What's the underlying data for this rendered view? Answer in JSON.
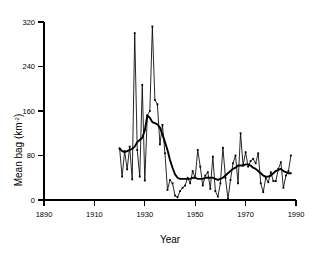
{
  "chart_data": {
    "type": "line",
    "title": "",
    "xlabel": "Year",
    "ylabel": "Mean bag (km",
    "ylabel_sup": "-2",
    "ylabel_suffix": ")",
    "xlim": [
      1890,
      1990
    ],
    "ylim": [
      0,
      320
    ],
    "xticks": [
      1890,
      1910,
      1930,
      1950,
      1970,
      1990
    ],
    "yticks": [
      0,
      80,
      160,
      240,
      320
    ],
    "grid": false,
    "legend": "none",
    "series": [
      {
        "name": "Annual mean bag",
        "style": "thin-line-with-markers",
        "x": [
          1920,
          1921,
          1922,
          1923,
          1924,
          1925,
          1926,
          1927,
          1928,
          1929,
          1930,
          1931,
          1932,
          1933,
          1934,
          1935,
          1936,
          1937,
          1938,
          1939,
          1940,
          1941,
          1942,
          1943,
          1944,
          1945,
          1946,
          1947,
          1948,
          1949,
          1950,
          1951,
          1952,
          1953,
          1954,
          1955,
          1956,
          1957,
          1958,
          1959,
          1960,
          1961,
          1962,
          1963,
          1964,
          1965,
          1966,
          1967,
          1968,
          1969,
          1970,
          1971,
          1972,
          1973,
          1974,
          1975,
          1976,
          1977,
          1978,
          1979,
          1980,
          1981,
          1982,
          1983,
          1984,
          1985,
          1986,
          1987,
          1988
        ],
        "values": [
          93,
          42,
          88,
          55,
          96,
          37,
          300,
          90,
          42,
          207,
          35,
          152,
          160,
          312,
          180,
          172,
          100,
          135,
          84,
          18,
          36,
          30,
          8,
          5,
          16,
          22,
          26,
          40,
          30,
          52,
          40,
          90,
          60,
          26,
          44,
          50,
          20,
          78,
          16,
          6,
          30,
          94,
          40,
          2,
          36,
          66,
          80,
          30,
          120,
          62,
          86,
          60,
          70,
          74,
          66,
          84,
          30,
          14,
          40,
          32,
          50,
          34,
          34,
          56,
          68,
          22,
          44,
          52,
          80
        ]
      },
      {
        "name": "Smoothed trend",
        "style": "thick-line",
        "x": [
          1920,
          1921,
          1922,
          1923,
          1924,
          1925,
          1926,
          1927,
          1928,
          1929,
          1930,
          1931,
          1932,
          1933,
          1934,
          1935,
          1936,
          1937,
          1938,
          1939,
          1940,
          1941,
          1942,
          1943,
          1944,
          1945,
          1946,
          1947,
          1948,
          1949,
          1950,
          1951,
          1952,
          1953,
          1954,
          1955,
          1956,
          1957,
          1958,
          1959,
          1960,
          1961,
          1962,
          1963,
          1964,
          1965,
          1966,
          1967,
          1968,
          1969,
          1970,
          1971,
          1972,
          1973,
          1974,
          1975,
          1976,
          1977,
          1978,
          1979,
          1980,
          1981,
          1982,
          1983,
          1984,
          1985,
          1986,
          1987,
          1988
        ],
        "values": [
          92,
          88,
          86,
          88,
          90,
          92,
          96,
          104,
          108,
          112,
          125,
          152,
          148,
          140,
          138,
          136,
          130,
          118,
          104,
          90,
          72,
          58,
          46,
          40,
          38,
          38,
          38,
          38,
          38,
          40,
          40,
          38,
          38,
          38,
          40,
          40,
          40,
          40,
          38,
          36,
          38,
          40,
          44,
          48,
          52,
          56,
          58,
          62,
          62,
          62,
          64,
          64,
          62,
          58,
          56,
          52,
          48,
          44,
          42,
          42,
          44,
          48,
          52,
          54,
          56,
          52,
          50,
          48,
          48
        ]
      }
    ]
  },
  "axes": {
    "y_label_main": "Mean bag (km",
    "y_label_sup": "-2",
    "y_label_end": ")",
    "x_label": "Year",
    "x_tick_labels": [
      "1890",
      "1910",
      "1930",
      "1950",
      "1970",
      "1990"
    ],
    "y_tick_labels": [
      "0",
      "80",
      "160",
      "240",
      "320"
    ]
  }
}
